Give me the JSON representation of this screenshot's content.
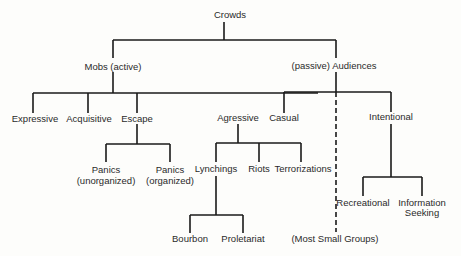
{
  "diagram": {
    "title": "Crowds",
    "nodes": {
      "crowds": "Crowds",
      "mobs": "Mobs (active)",
      "audiences": "(passive) Audiences",
      "expressive": "Expressive",
      "acquisitive": "Acquisitive",
      "escape": "Escape",
      "agressive": "Agressive",
      "casual": "Casual",
      "intentional": "Intentional",
      "panics_unorganized_line1": "Panics",
      "panics_unorganized_line2": "(unorganized)",
      "panics_organized_line1": "Panics",
      "panics_organized_line2": "(organized)",
      "lynchings": "Lynchings",
      "riots": "Riots",
      "terrorizations": "Terrorizations",
      "bourbon": "Bourbon",
      "proletariat": "Proletariat",
      "recreational": "Recreational",
      "information_seeking_line1": "Information",
      "information_seeking_line2": "Seeking",
      "most_small_groups": "(Most Small Groups)"
    },
    "hierarchy": [
      {
        "parent": "Crowds",
        "children": [
          "Mobs (active)",
          "(passive) Audiences"
        ]
      },
      {
        "parent": "Mobs (active)",
        "children": [
          "Expressive",
          "Acquisitive",
          "Escape",
          "Agressive"
        ]
      },
      {
        "parent": "Escape",
        "children": [
          "Panics (unorganized)",
          "Panics (organized)"
        ]
      },
      {
        "parent": "Agressive",
        "children": [
          "Lynchings",
          "Riots",
          "Terrorizations"
        ]
      },
      {
        "parent": "Lynchings",
        "children": [
          "Bourbon",
          "Proletariat"
        ]
      },
      {
        "parent": "(passive) Audiences",
        "children": [
          "Casual",
          "Intentional"
        ]
      },
      {
        "parent": "Intentional",
        "children": [
          "Recreational",
          "Information Seeking"
        ]
      },
      {
        "parent": "(passive) Audiences",
        "children": [
          "(Most Small Groups)"
        ],
        "style": "dashed"
      }
    ]
  }
}
